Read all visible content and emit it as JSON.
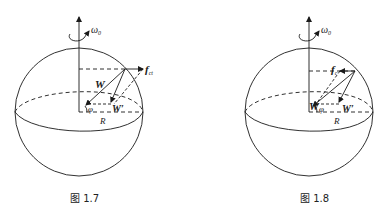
{
  "figures": [
    {
      "id": "fig-1-7",
      "caption": "图 1.7",
      "labels": {
        "omega": "ω",
        "omega_sub": "0",
        "force": "f",
        "force_sub": "ct",
        "weight": "W",
        "weight_prime": "W′",
        "latitude": "φ",
        "radius": "R"
      },
      "force_direction": "outward"
    },
    {
      "id": "fig-1-8",
      "caption": "图 1.8",
      "labels": {
        "omega": "ω",
        "omega_sub": "0",
        "force": "f",
        "force_sub": "c",
        "weight": "W",
        "weight_prime": "W′",
        "latitude": "φ",
        "radius": "R"
      },
      "force_direction": "inward"
    }
  ],
  "colors": {
    "stroke": "#1a1a1a",
    "background": "#ffffff"
  }
}
